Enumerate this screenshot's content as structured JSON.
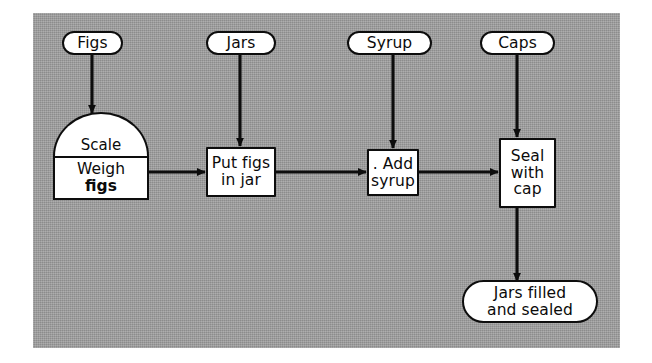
{
  "diagram": {
    "background_color": "#9c9c9c",
    "node_fill": "#ffffff",
    "stroke_color": "#0d0d0d",
    "inputs": [
      {
        "id": "figs",
        "label": "Figs"
      },
      {
        "id": "jars",
        "label": "Jars"
      },
      {
        "id": "syrup",
        "label": "Syrup"
      },
      {
        "id": "caps",
        "label": "Caps"
      }
    ],
    "process": [
      {
        "id": "weigh-figs",
        "resource_label": "Scale",
        "line1": "Weigh",
        "line2": "figs"
      },
      {
        "id": "put-figs-in-jar",
        "label": "Put figs\nin jar"
      },
      {
        "id": "add-syrup",
        "label": ". Add\nsyrup"
      },
      {
        "id": "seal-with-cap",
        "label": "Seal\nwith\ncap"
      }
    ],
    "output": {
      "id": "jars-filled-and-sealed",
      "label": "Jars filled\nand sealed"
    }
  }
}
